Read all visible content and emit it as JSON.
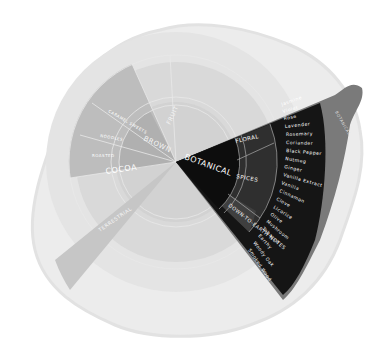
{
  "wheel": {
    "title": "Flavor Wheel",
    "highlighted_category": "BOTANICAL",
    "colors": {
      "background": "#ffffff",
      "paper": "#ececec",
      "paper_edge": "#e2e2e2",
      "faded_outer": "#d9d9d9",
      "faded_mid": "#c4c4c4",
      "faded_inner": "#b5b5b5",
      "highlight_inner": "#0d0d0d",
      "highlight_mid": "#2a2a2a",
      "highlight_mid_alt": "#3b3b3b",
      "highlight_outer": "#151515",
      "highlight_shadow": "#7a7a7a",
      "text_light": "#ffffff"
    },
    "inner_ring": [
      {
        "label": "BOTANICAL",
        "highlighted": true
      },
      {
        "label": "BROWN",
        "highlighted": false
      },
      {
        "label": "FRUIT",
        "highlighted": false
      },
      {
        "label": "TERRESTRIAL",
        "highlighted": false
      }
    ],
    "middle_ring": [
      {
        "label": "FLORAL",
        "parent": "BOTANICAL"
      },
      {
        "label": "SPICES",
        "parent": "BOTANICAL"
      },
      {
        "label": "DOWN-TO-EARTH NOTES",
        "parent": "BOTANICAL"
      },
      {
        "label": "COCOA",
        "parent": "BROWN"
      },
      {
        "label": "ROASTED",
        "parent": "BROWN"
      },
      {
        "label": "NOODLES",
        "parent": "BROWN"
      },
      {
        "label": "CARAMEL SWEETS",
        "parent": "BROWN"
      }
    ],
    "outer_ring_botanical": [
      "Jasmine",
      "Violet",
      "Rose",
      "Lavender",
      "Rosemary",
      "Coriander",
      "Black Pepper",
      "Nutmeg",
      "Ginger",
      "Vanilla Extract",
      "Vanilla",
      "Cinnamon",
      "Clove",
      "Licorice",
      "Olive",
      "Mushroom",
      "Tobacco",
      "Earthy",
      "Woody Oak",
      "Smoked Wood"
    ],
    "edge_label": "BOTANICAL"
  }
}
